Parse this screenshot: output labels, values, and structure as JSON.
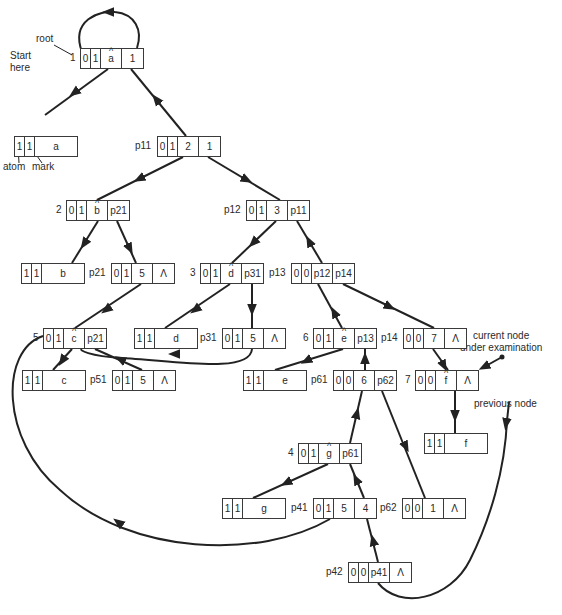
{
  "diagram": {
    "type": "linked-list-structure",
    "annotations": {
      "root": "root",
      "start": "Start\nhere",
      "atom": "atom",
      "mark": "mark",
      "current": "current node\nunder examination",
      "previous": "previous node"
    },
    "nodes": [
      {
        "id": "1",
        "label": "1",
        "cells": [
          "0",
          "1",
          "a",
          "1"
        ],
        "hat": true
      },
      {
        "id": "a",
        "label": "",
        "cells": [
          "1",
          "1",
          "a"
        ],
        "atom": true
      },
      {
        "id": "p11",
        "label": "p11",
        "cells": [
          "0",
          "1",
          "2",
          "1"
        ]
      },
      {
        "id": "2",
        "label": "2",
        "cells": [
          "0",
          "1",
          "b",
          "p21"
        ],
        "hat": true
      },
      {
        "id": "p12",
        "label": "p12",
        "cells": [
          "0",
          "1",
          "3",
          "p11"
        ]
      },
      {
        "id": "b",
        "label": "",
        "cells": [
          "1",
          "1",
          "b"
        ],
        "atom": true
      },
      {
        "id": "p21",
        "label": "p21",
        "cells": [
          "0",
          "1",
          "5",
          "Λ"
        ]
      },
      {
        "id": "3",
        "label": "3",
        "cells": [
          "0",
          "1",
          "d",
          "p31"
        ],
        "hat": true
      },
      {
        "id": "p13",
        "label": "p13",
        "cells": [
          "0",
          "0",
          "p12",
          "p14"
        ]
      },
      {
        "id": "5",
        "label": "5",
        "cells": [
          "0",
          "1",
          "c",
          "p21"
        ],
        "hat": true
      },
      {
        "id": "d",
        "label": "",
        "cells": [
          "1",
          "1",
          "d"
        ],
        "atom": true
      },
      {
        "id": "p31",
        "label": "p31",
        "cells": [
          "0",
          "1",
          "5",
          "Λ"
        ]
      },
      {
        "id": "6",
        "label": "6",
        "cells": [
          "0",
          "1",
          "e",
          "p13"
        ],
        "hat": true
      },
      {
        "id": "p14",
        "label": "p14",
        "cells": [
          "0",
          "0",
          "7",
          "Λ"
        ]
      },
      {
        "id": "c",
        "label": "",
        "cells": [
          "1",
          "1",
          "c"
        ],
        "atom": true
      },
      {
        "id": "p51",
        "label": "p51",
        "cells": [
          "0",
          "1",
          "5",
          "Λ"
        ]
      },
      {
        "id": "e",
        "label": "",
        "cells": [
          "1",
          "1",
          "e"
        ],
        "atom": true
      },
      {
        "id": "p61",
        "label": "p61",
        "cells": [
          "0",
          "0",
          "6",
          "p62"
        ]
      },
      {
        "id": "7",
        "label": "7",
        "cells": [
          "0",
          "0",
          "f",
          "Λ"
        ],
        "hat": true
      },
      {
        "id": "4",
        "label": "4",
        "cells": [
          "0",
          "1",
          "g",
          "p61"
        ],
        "hat": true
      },
      {
        "id": "f",
        "label": "",
        "cells": [
          "1",
          "1",
          "f"
        ],
        "atom": true
      },
      {
        "id": "g",
        "label": "",
        "cells": [
          "1",
          "1",
          "g"
        ],
        "atom": true
      },
      {
        "id": "p41",
        "label": "p41",
        "cells": [
          "0",
          "1",
          "5",
          "4"
        ]
      },
      {
        "id": "p62",
        "label": "p62",
        "cells": [
          "0",
          "0",
          "1",
          "Λ"
        ]
      },
      {
        "id": "p42",
        "label": "p42",
        "cells": [
          "0",
          "0",
          "p41",
          "Λ"
        ]
      }
    ]
  }
}
